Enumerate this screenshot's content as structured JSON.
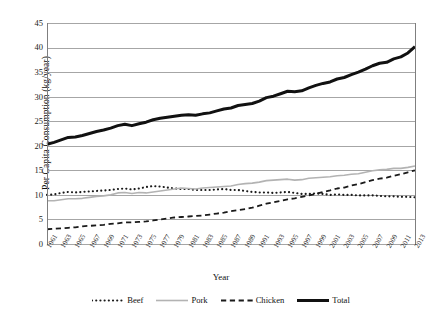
{
  "chart_data": {
    "type": "line",
    "title": "",
    "xlabel": "Year",
    "ylabel": "Per Capita Consumption (kg/year)",
    "ylim": [
      0,
      45
    ],
    "yticks": [
      0,
      5,
      10,
      15,
      20,
      25,
      30,
      35,
      40,
      45
    ],
    "grid": true,
    "legend_position": "bottom",
    "x": [
      1961,
      1962,
      1963,
      1964,
      1965,
      1966,
      1967,
      1968,
      1969,
      1970,
      1971,
      1972,
      1973,
      1974,
      1975,
      1976,
      1977,
      1978,
      1979,
      1980,
      1981,
      1982,
      1983,
      1984,
      1985,
      1986,
      1987,
      1988,
      1989,
      1990,
      1991,
      1992,
      1993,
      1994,
      1995,
      1996,
      1997,
      1998,
      1999,
      2000,
      2001,
      2002,
      2003,
      2004,
      2005,
      2006,
      2007,
      2008,
      2009,
      2010,
      2011,
      2012,
      2013
    ],
    "xtick_labels": [
      "1961",
      "1963",
      "1965",
      "1967",
      "1969",
      "1971",
      "1973",
      "1975",
      "1977",
      "1979",
      "1981",
      "1983",
      "1985",
      "1987",
      "1989",
      "1991",
      "1993",
      "1995",
      "1997",
      "1999",
      "2001",
      "2003",
      "2005",
      "2007",
      "2009",
      "2011",
      "2013"
    ],
    "series": [
      {
        "name": "Beef",
        "style": "dotted",
        "color": "#1a1a1a",
        "width": 2.1,
        "values": [
          10.0,
          10.1,
          10.4,
          10.6,
          10.5,
          10.6,
          10.7,
          10.8,
          10.9,
          11.0,
          11.2,
          11.3,
          11.1,
          11.3,
          11.6,
          11.8,
          11.7,
          11.5,
          11.3,
          11.2,
          11.2,
          11.0,
          11.0,
          11.0,
          11.1,
          11.2,
          11.0,
          11.0,
          10.8,
          10.6,
          10.5,
          10.5,
          10.4,
          10.5,
          10.6,
          10.4,
          10.2,
          10.2,
          10.3,
          10.2,
          10.0,
          10.1,
          10.0,
          10.0,
          9.9,
          9.9,
          9.9,
          9.8,
          9.7,
          9.7,
          9.6,
          9.6,
          9.5
        ]
      },
      {
        "name": "Pork",
        "style": "solid",
        "color": "#b3b3b3",
        "width": 1.6,
        "values": [
          8.8,
          8.8,
          9.0,
          9.2,
          9.2,
          9.3,
          9.5,
          9.7,
          9.8,
          10.0,
          10.4,
          10.5,
          10.3,
          10.5,
          10.4,
          10.6,
          10.8,
          11.0,
          11.2,
          11.4,
          11.3,
          11.2,
          11.4,
          11.5,
          11.6,
          11.7,
          11.8,
          12.1,
          12.3,
          12.4,
          12.6,
          12.9,
          13.0,
          13.1,
          13.2,
          13.0,
          13.1,
          13.4,
          13.5,
          13.6,
          13.7,
          13.9,
          14.0,
          14.2,
          14.3,
          14.6,
          14.9,
          15.1,
          15.2,
          15.4,
          15.4,
          15.6,
          15.9
        ]
      },
      {
        "name": "Chicken",
        "style": "dashed",
        "color": "#1a1a1a",
        "width": 1.8,
        "values": [
          3.0,
          3.1,
          3.2,
          3.3,
          3.4,
          3.6,
          3.7,
          3.8,
          3.9,
          4.1,
          4.2,
          4.4,
          4.4,
          4.5,
          4.6,
          4.8,
          5.0,
          5.2,
          5.4,
          5.5,
          5.6,
          5.7,
          5.8,
          6.0,
          6.2,
          6.4,
          6.7,
          6.9,
          7.1,
          7.4,
          7.8,
          8.2,
          8.5,
          8.8,
          9.1,
          9.3,
          9.6,
          9.9,
          10.2,
          10.6,
          10.9,
          11.3,
          11.5,
          11.9,
          12.2,
          12.6,
          13.0,
          13.3,
          13.5,
          13.9,
          14.2,
          14.6,
          15.0
        ]
      },
      {
        "name": "Total",
        "style": "thick-solid",
        "color": "#111111",
        "width": 3.0,
        "values": [
          20.3,
          20.7,
          21.2,
          21.7,
          21.8,
          22.1,
          22.5,
          22.9,
          23.2,
          23.6,
          24.1,
          24.4,
          24.1,
          24.5,
          24.8,
          25.3,
          25.6,
          25.8,
          26.0,
          26.2,
          26.3,
          26.2,
          26.5,
          26.7,
          27.1,
          27.5,
          27.7,
          28.2,
          28.4,
          28.6,
          29.1,
          29.8,
          30.1,
          30.6,
          31.1,
          31.0,
          31.2,
          31.8,
          32.3,
          32.7,
          33.0,
          33.6,
          33.9,
          34.5,
          35.0,
          35.6,
          36.3,
          36.8,
          37.0,
          37.7,
          38.1,
          38.9,
          40.2
        ]
      }
    ]
  },
  "legend": {
    "items": [
      {
        "label": "Beef"
      },
      {
        "label": "Pork"
      },
      {
        "label": "Chicken"
      },
      {
        "label": "Total"
      }
    ]
  }
}
